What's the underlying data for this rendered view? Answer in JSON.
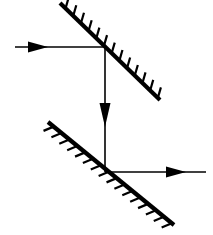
{
  "figure": {
    "type": "optics-ray-diagram",
    "width": 213,
    "height": 235,
    "background_color": "#ffffff",
    "ink_color": "#000000"
  },
  "mirrors": [
    {
      "name": "upper-mirror",
      "label": "upper mirror",
      "x1": 60,
      "y1": 3,
      "x2": 160,
      "y2": 100,
      "angle_deg": -45,
      "line_width": 4.2,
      "hatch_side": "upper-right",
      "hatch_count": 13,
      "hatch_length": 11,
      "hatch_angle_deg": 62,
      "hatch_width": 2.2,
      "color": "#000000"
    },
    {
      "name": "lower-mirror",
      "label": "lower mirror",
      "x1": 48,
      "y1": 122,
      "x2": 174,
      "y2": 225,
      "angle_deg": -45,
      "line_width": 4.2,
      "hatch_side": "lower-left",
      "hatch_count": 16,
      "hatch_length": 11,
      "hatch_angle_deg": 62,
      "hatch_width": 2.2,
      "color": "#000000"
    }
  ],
  "rays": [
    {
      "name": "incident-ray",
      "label": "incoming horizontal ray",
      "direction": "right",
      "x1": 15,
      "y1": 47,
      "x2": 105,
      "y2": 47,
      "line_width": 1.6,
      "arrow": {
        "name": "incident-ray-arrowhead",
        "tip_x": 48,
        "tip_y": 47,
        "length": 20,
        "half_width": 5.5,
        "direction": "right"
      },
      "color": "#000000"
    },
    {
      "name": "vertical-ray",
      "label": "downward vertical ray",
      "direction": "down",
      "x1": 105,
      "y1": 47,
      "x2": 105,
      "y2": 172,
      "line_width": 1.6,
      "arrow": {
        "name": "vertical-ray-arrowhead",
        "tip_x": 105,
        "tip_y": 127,
        "length": 24,
        "half_width": 5.5,
        "direction": "down"
      },
      "color": "#000000"
    },
    {
      "name": "reflected-ray",
      "label": "outgoing horizontal ray",
      "direction": "right",
      "x1": 105,
      "y1": 172,
      "x2": 206,
      "y2": 172,
      "line_width": 1.6,
      "arrow": {
        "name": "reflected-ray-arrowhead",
        "tip_x": 186,
        "tip_y": 172,
        "length": 20,
        "half_width": 5.5,
        "direction": "right"
      },
      "color": "#000000"
    }
  ],
  "intersections": [
    {
      "name": "upper-reflection-point",
      "label": "upper mirror reflection point",
      "x": 105,
      "y": 47
    },
    {
      "name": "lower-reflection-point",
      "label": "lower mirror reflection point",
      "x": 105,
      "y": 172
    }
  ]
}
